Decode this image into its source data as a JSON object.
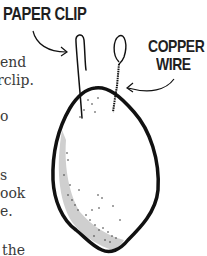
{
  "illustration": {
    "labels": {
      "paper_clip": "PAPER CLIP",
      "copper_wire_line1": "COPPER",
      "copper_wire_line2": "WIRE"
    },
    "subject": "lemon-battery",
    "colors": {
      "ink": "#111111",
      "shading": "#c8c8c8",
      "text": "#3a3a3a"
    }
  },
  "body_text_fragments": [
    "end",
    "rclip.",
    "o",
    "s",
    "ook",
    "e.",
    "the"
  ]
}
